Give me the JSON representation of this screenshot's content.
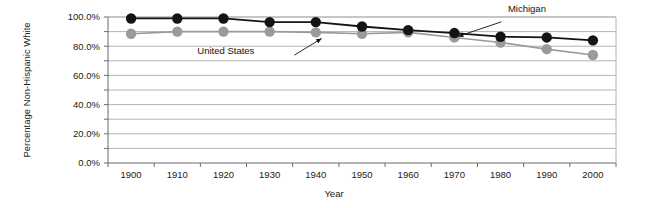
{
  "chart_data": {
    "type": "line",
    "title": "",
    "xlabel": "Year",
    "ylabel": "Percentage Non-Hispanic White",
    "x": [
      1900,
      1910,
      1920,
      1930,
      1940,
      1950,
      1960,
      1970,
      1980,
      1990,
      2000
    ],
    "categories": [
      "1900",
      "1910",
      "1920",
      "1930",
      "1940",
      "1950",
      "1960",
      "1970",
      "1980",
      "1990",
      "2000"
    ],
    "series": [
      {
        "name": "Michigan",
        "color": "#141414",
        "marker": "circle",
        "values": [
          99.0,
          99.0,
          99.0,
          96.5,
          96.5,
          93.5,
          91.0,
          89.0,
          86.5,
          86.0,
          84.0
        ]
      },
      {
        "name": "United States",
        "color": "#9a9a9a",
        "marker": "circle",
        "values": [
          88.5,
          90.0,
          90.0,
          90.0,
          89.5,
          88.5,
          89.5,
          86.0,
          82.5,
          78.0,
          74.0
        ]
      }
    ],
    "xlim": [
      1895,
      2005
    ],
    "ylim": [
      0,
      100
    ],
    "ytick_values": [
      0,
      20,
      40,
      60,
      80,
      100
    ],
    "ytick_labels": [
      "0.0%",
      "20.0%",
      "40.0%",
      "60.0%",
      "80.0%",
      "100.0%"
    ],
    "yminor_tick_values": [
      10,
      30,
      50,
      70,
      90
    ],
    "gridlines": {
      "horizontal": true,
      "horizontal_interval": 10,
      "vertical": false,
      "color": "#b3b3b3"
    },
    "legend_position": "annotations-on-plot",
    "annotations": [
      {
        "label": "Michigan",
        "target_series": "Michigan",
        "target_x": 1980,
        "label_x_pct": 78.5,
        "label_y_pct": 6.0,
        "arrow_from_x_pct": 77.5,
        "arrow_from_y_pct": 10.5,
        "arrow_to_x_pct": 70.8,
        "arrow_to_y_pct": 17.5
      },
      {
        "label": "United States",
        "target_series": "United States",
        "target_x": 1950,
        "label_x_pct": 30.5,
        "label_y_pct": 26.0,
        "arrow_from_x_pct": 45.5,
        "arrow_from_y_pct": 26.5,
        "arrow_to_x_pct": 49.7,
        "arrow_to_y_pct": 18.5
      }
    ]
  },
  "axes": {
    "y_axis_title": "Percentage Non-Hispanic White",
    "x_axis_title": "Year",
    "y_tick_labels": [
      "100.0%",
      "80.0%",
      "60.0%",
      "40.0%",
      "20.0%",
      "0.0%"
    ],
    "x_tick_labels": [
      "1900",
      "1910",
      "1920",
      "1930",
      "1940",
      "1950",
      "1960",
      "1970",
      "1980",
      "1990",
      "2000"
    ]
  },
  "annotations": {
    "michigan_label": "Michigan",
    "united_states_label": "United States"
  },
  "colors": {
    "michigan": "#141414",
    "united_states": "#9a9a9a",
    "gridline": "#b3b3b3",
    "axis": "#6b6b6b",
    "text": "#1a1a1a",
    "background": "#ffffff"
  }
}
